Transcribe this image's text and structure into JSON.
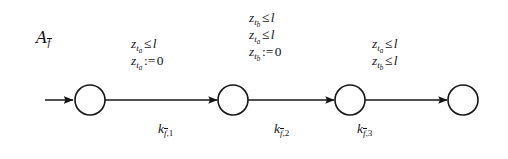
{
  "figure": {
    "type": "timed-automaton-diagram",
    "width": 508,
    "height": 159,
    "background_color": "#ffffff",
    "ink_color": "#161616"
  },
  "automaton": {
    "name_base": "A",
    "name_subscript": "f",
    "name_subscript_overbar": true,
    "name_plain": "A_f̄"
  },
  "states": [
    {
      "id": "s0",
      "label": "",
      "cx": 90,
      "cy": 100,
      "r": 15
    },
    {
      "id": "s1",
      "label": "",
      "cx": 233,
      "cy": 100,
      "r": 15
    },
    {
      "id": "s2",
      "label": "",
      "cx": 350,
      "cy": 100,
      "r": 15
    },
    {
      "id": "s3",
      "label": "",
      "cx": 463,
      "cy": 100,
      "r": 15
    }
  ],
  "initial_arrow": {
    "from_x": 45,
    "to_x": 74,
    "y": 100
  },
  "transitions": [
    {
      "id": "t1",
      "from": "s0",
      "to": "s1",
      "name": {
        "base": "k",
        "sub_var": "f",
        "sub_overbar": true,
        "sub_index": "1",
        "plain": "k_{f̄,1}"
      },
      "guards": [
        {
          "clock": "z",
          "clock_sub": "t",
          "clock_sub_sub": "a",
          "op": "≤",
          "value": "l",
          "plain": "z_{t_a} ≤ l"
        },
        {
          "clock": "z",
          "clock_sub": "t",
          "clock_sub_sub": "a",
          "op": ":=",
          "value": "0",
          "plain": "z_{t_a} := 0"
        }
      ]
    },
    {
      "id": "t2",
      "from": "s1",
      "to": "s2",
      "name": {
        "base": "k",
        "sub_var": "f",
        "sub_overbar": true,
        "sub_index": "2",
        "plain": "k_{f̄,2}"
      },
      "guards": [
        {
          "clock": "z",
          "clock_sub": "t",
          "clock_sub_sub": "b",
          "op": "≤",
          "value": "l",
          "plain": "z_{t_b} ≤ l"
        },
        {
          "clock": "z",
          "clock_sub": "t",
          "clock_sub_sub": "a",
          "op": "≤",
          "value": "l",
          "plain": "z_{t_a} ≤ l"
        },
        {
          "clock": "z",
          "clock_sub": "t",
          "clock_sub_sub": "b",
          "op": ":=",
          "value": "0",
          "plain": "z_{t_b} := 0"
        }
      ]
    },
    {
      "id": "t3",
      "from": "s2",
      "to": "s3",
      "name": {
        "base": "k",
        "sub_var": "f",
        "sub_overbar": true,
        "sub_index": "3",
        "plain": "k_{f̄,3}"
      },
      "guards": [
        {
          "clock": "z",
          "clock_sub": "t",
          "clock_sub_sub": "a",
          "op": "≤",
          "value": "l",
          "plain": "z_{t_a} ≤ l"
        },
        {
          "clock": "z",
          "clock_sub": "t",
          "clock_sub_sub": "b",
          "op": "≤",
          "value": "l",
          "plain": "z_{t_b} ≤ l"
        }
      ]
    }
  ],
  "symbols": {
    "leq": "≤",
    "assign": ":=",
    "comma": ","
  }
}
